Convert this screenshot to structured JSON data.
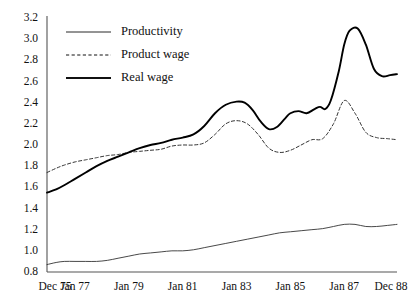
{
  "chart_data": {
    "type": "line",
    "title": "",
    "subtitle": "",
    "xlabel": "",
    "ylabel": "",
    "grid": false,
    "legend_position": "top-left",
    "ylim": [
      0.8,
      3.2
    ],
    "yticks": [
      "0.8",
      "1.0",
      "1.2",
      "1.4",
      "1.6",
      "1.8",
      "2.0",
      "2.2",
      "2.4",
      "2.6",
      "2.8",
      "3.0",
      "3.2"
    ],
    "ytick_values": [
      0.8,
      1.0,
      1.2,
      1.4,
      1.6,
      1.8,
      2.0,
      2.2,
      2.4,
      2.6,
      2.8,
      3.0,
      3.2
    ],
    "xticks": [
      "Dec 75",
      "Jan 77",
      "Jan 79",
      "Jan 81",
      "Jan 83",
      "Jan 85",
      "Jan 87",
      "Dec 88"
    ],
    "xtick_values": [
      1975.96,
      1977.0,
      1979.0,
      1981.0,
      1983.0,
      1985.0,
      1987.0,
      1988.96
    ],
    "xlim": [
      1975.96,
      1988.96
    ],
    "series": [
      {
        "name": "Productivity",
        "style": "thin-solid",
        "color": "#333333",
        "x": [
          1975.96,
          1976.3,
          1976.6,
          1977.0,
          1977.4,
          1977.8,
          1978.2,
          1978.6,
          1979.0,
          1979.4,
          1979.8,
          1980.2,
          1980.6,
          1981.0,
          1981.4,
          1981.8,
          1982.2,
          1982.6,
          1983.0,
          1983.4,
          1983.8,
          1984.2,
          1984.6,
          1985.0,
          1985.4,
          1985.8,
          1986.2,
          1986.6,
          1987.0,
          1987.4,
          1987.8,
          1988.2,
          1988.6,
          1988.96
        ],
        "values": [
          0.87,
          0.89,
          0.9,
          0.9,
          0.9,
          0.9,
          0.91,
          0.93,
          0.95,
          0.97,
          0.98,
          0.99,
          1.0,
          1.0,
          1.01,
          1.03,
          1.05,
          1.07,
          1.09,
          1.11,
          1.13,
          1.15,
          1.17,
          1.18,
          1.19,
          1.2,
          1.21,
          1.23,
          1.25,
          1.25,
          1.23,
          1.23,
          1.24,
          1.25
        ]
      },
      {
        "name": "Product wage",
        "style": "dashed",
        "color": "#333333",
        "x": [
          1975.96,
          1976.3,
          1976.6,
          1977.0,
          1977.4,
          1977.8,
          1978.2,
          1978.6,
          1979.0,
          1979.4,
          1979.8,
          1980.2,
          1980.6,
          1981.0,
          1981.4,
          1981.8,
          1982.2,
          1982.6,
          1983.0,
          1983.4,
          1983.8,
          1984.2,
          1984.6,
          1985.0,
          1985.4,
          1985.8,
          1986.2,
          1986.6,
          1987.0,
          1987.4,
          1987.8,
          1988.2,
          1988.6,
          1988.96
        ],
        "values": [
          1.74,
          1.78,
          1.81,
          1.84,
          1.86,
          1.88,
          1.9,
          1.91,
          1.93,
          1.94,
          1.95,
          1.96,
          1.99,
          2.0,
          2.0,
          2.02,
          2.1,
          2.2,
          2.23,
          2.2,
          2.1,
          1.97,
          1.93,
          1.95,
          2.0,
          2.05,
          2.06,
          2.2,
          2.42,
          2.3,
          2.12,
          2.07,
          2.06,
          2.05
        ]
      },
      {
        "name": "Real wage",
        "style": "thick-solid",
        "color": "#000000",
        "x": [
          1975.96,
          1976.3,
          1976.6,
          1977.0,
          1977.4,
          1977.8,
          1978.2,
          1978.6,
          1979.0,
          1979.4,
          1979.8,
          1980.2,
          1980.6,
          1981.0,
          1981.4,
          1981.8,
          1982.2,
          1982.6,
          1983.0,
          1983.3,
          1983.6,
          1983.9,
          1984.2,
          1984.5,
          1984.8,
          1985.0,
          1985.3,
          1985.6,
          1985.9,
          1986.1,
          1986.3,
          1986.5,
          1986.8,
          1987.0,
          1987.2,
          1987.5,
          1987.8,
          1988.1,
          1988.4,
          1988.7,
          1988.96
        ],
        "values": [
          1.55,
          1.58,
          1.62,
          1.68,
          1.74,
          1.8,
          1.85,
          1.89,
          1.93,
          1.97,
          2.0,
          2.02,
          2.05,
          2.07,
          2.1,
          2.18,
          2.3,
          2.38,
          2.41,
          2.4,
          2.33,
          2.22,
          2.15,
          2.17,
          2.25,
          2.3,
          2.32,
          2.3,
          2.34,
          2.36,
          2.34,
          2.42,
          2.7,
          2.95,
          3.08,
          3.1,
          2.95,
          2.72,
          2.65,
          2.66,
          2.67
        ]
      }
    ]
  },
  "legend": {
    "items": [
      {
        "label": "Productivity",
        "style": "thin-solid"
      },
      {
        "label": "Product wage",
        "style": "dashed"
      },
      {
        "label": "Real wage",
        "style": "thick-solid"
      }
    ]
  }
}
